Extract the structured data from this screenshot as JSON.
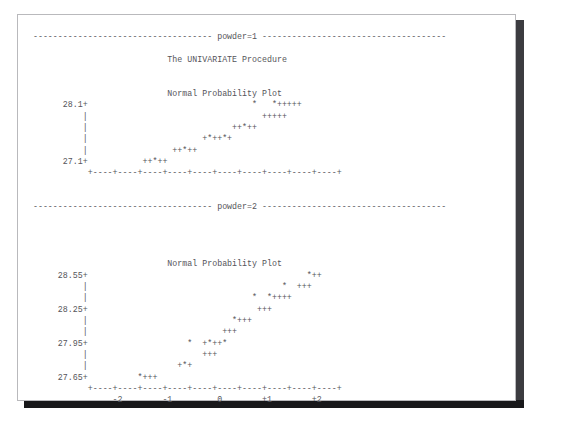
{
  "app": {
    "kind": "sas-listing-output",
    "page_background": "#ffffff",
    "text_color": "#55555a",
    "shadow_color": "#18181a"
  },
  "report": {
    "procedure_title": "The UNIVARIATE Procedure",
    "plot_title": "Normal Probability Plot",
    "by_group_label_1": "powder=1",
    "by_group_label_2": "powder=2",
    "separator_dash": "-"
  },
  "chart_data": [
    {
      "type": "scatter",
      "title": "Normal Probability Plot",
      "group": "powder=1",
      "xlabel": "",
      "ylabel": "",
      "grid": false,
      "legend": "none",
      "xlim": [
        -2.5,
        2.5
      ],
      "ylim": [
        27.1,
        28.1
      ],
      "x_tick_labels": [
        "-2",
        "-1",
        "0",
        "+1",
        "+2"
      ],
      "y_tick_labels": [
        "28.1",
        "27.1"
      ],
      "y_axis_tick_rows": 4,
      "markers": {
        "data": "*",
        "reference": "+"
      },
      "rows": [
        {
          "y_label": "28.1+",
          "tick": "+",
          "text": "*  *+++++",
          "col": 47
        },
        {
          "y_label": "",
          "tick": "|",
          "text": "+++++",
          "col": 49
        },
        {
          "y_label": "",
          "tick": "|",
          "text": "++*++",
          "col": 42
        },
        {
          "y_label": "",
          "tick": "|",
          "text": "+*++*+",
          "col": 34
        },
        {
          "y_label": "",
          "tick": "|",
          "text": "++*++",
          "col": 26
        },
        {
          "y_label": "27.1+",
          "tick": "+",
          "text": "++*++",
          "col": 16
        }
      ],
      "axis_line": "+----+----+----+----+----+----+----+----+----+----+"
    },
    {
      "type": "scatter",
      "title": "Normal Probability Plot",
      "group": "powder=2",
      "xlabel": "",
      "ylabel": "",
      "grid": false,
      "legend": "none",
      "xlim": [
        -2.5,
        2.5
      ],
      "ylim": [
        27.65,
        28.55
      ],
      "x_tick_labels": [
        "-2",
        "-1",
        "0",
        "+1",
        "+2"
      ],
      "y_tick_labels": [
        "28.55",
        "28.25",
        "27.95",
        "27.65"
      ],
      "y_axis_tick_rows": 2,
      "markers": {
        "data": "*",
        "reference": "+"
      },
      "rows": [
        {
          "y_label": "28.55+",
          "tick": "+",
          "text": "*++",
          "col": 45
        },
        {
          "y_label": "",
          "tick": "|",
          "text": "*  +++",
          "col": 39
        },
        {
          "y_label": "",
          "tick": "|",
          "text": "*  *++++",
          "col": 32
        },
        {
          "y_label": "28.25+",
          "tick": "+",
          "text": "+++",
          "col": 33
        },
        {
          "y_label": "",
          "tick": "|",
          "text": "*+++",
          "col": 28
        },
        {
          "y_label": "",
          "tick": "|",
          "text": "+++",
          "col": 26
        },
        {
          "y_label": "27.95+",
          "tick": "+",
          "text": "*  +*++*",
          "col": 19
        },
        {
          "y_label": "",
          "tick": "|",
          "text": "+++",
          "col": 22
        },
        {
          "y_label": "",
          "tick": "|",
          "text": "+*+",
          "col": 17
        },
        {
          "y_label": "27.65+",
          "tick": "+",
          "text": "*+++",
          "col": 9
        }
      ],
      "axis_line": "+----+----+----+----+----+----+----+----+----+----+",
      "axis_tick_label_line": "     -2        -1         0        +1        +2"
    }
  ],
  "lines": [
    "   ------------------------------------ powder=1 -------------------------------------",
    "",
    "                              The UNIVARIATE Procedure",
    "",
    "",
    "                              Normal Probability Plot",
    "         28.1+                                 *   *+++++",
    "             |                                   +++++",
    "             |                             ++*++",
    "             |                       +*++*+",
    "             |                 ++*++",
    "         27.1+           ++*++",
    "              +----+----+----+----+----+----+----+----+----+----+",
    "",
    "",
    "   ------------------------------------ powder=2 -------------------------------------",
    "",
    "",
    "",
    "",
    "                              Normal Probability Plot",
    "        28.55+                                            *++",
    "             |                                       *  +++",
    "             |                                 *  *++++",
    "        28.25+                                  +++",
    "             |                             *+++",
    "             |                           +++",
    "        27.95+                    *  +*++*",
    "             |                       +++",
    "             |                  +*+",
    "        27.65+          *+++",
    "              +----+----+----+----+----+----+----+----+----+----+",
    "                   -2        -1         0        +1        +2"
  ]
}
